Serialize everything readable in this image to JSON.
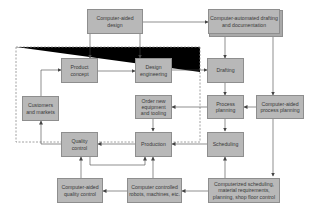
{
  "diagram": {
    "title": "",
    "boundary": "dashed",
    "nodes": [
      {
        "id": "cad",
        "label": "Computer-aided design"
      },
      {
        "id": "cadd",
        "label": "Computer-automated drafting and documentation"
      },
      {
        "id": "product_concept",
        "label": "Product concept"
      },
      {
        "id": "design_engineering",
        "label": "Design engineering"
      },
      {
        "id": "drafting",
        "label": "Drafting"
      },
      {
        "id": "customers",
        "label": "Customers and markets"
      },
      {
        "id": "order_equipment",
        "label": "Order new equipment and tooling"
      },
      {
        "id": "process_planning",
        "label": "Process planning"
      },
      {
        "id": "capp",
        "label": "Computer-aided process planning"
      },
      {
        "id": "quality_control",
        "label": "Quality control"
      },
      {
        "id": "production",
        "label": "Production"
      },
      {
        "id": "scheduling",
        "label": "Scheduling"
      },
      {
        "id": "caqc",
        "label": "Computer-aided quality control"
      },
      {
        "id": "robots",
        "label": "Computer controlled robots, machines, etc."
      },
      {
        "id": "computerized_scheduling",
        "label": "Computerized scheduling, material requirements, planning, shop floor control"
      }
    ],
    "edges": [
      {
        "from": "cad",
        "to": "cadd"
      },
      {
        "from": "cad",
        "to": "product_concept"
      },
      {
        "from": "cad",
        "to": "design_engineering"
      },
      {
        "from": "cadd",
        "to": "drafting"
      },
      {
        "from": "cadd",
        "to": "capp"
      },
      {
        "from": "customers",
        "to": "product_concept"
      },
      {
        "from": "product_concept",
        "to": "design_engineering"
      },
      {
        "from": "design_engineering",
        "to": "drafting"
      },
      {
        "from": "drafting",
        "to": "process_planning"
      },
      {
        "from": "capp",
        "to": "process_planning"
      },
      {
        "from": "process_planning",
        "to": "order_equipment"
      },
      {
        "from": "process_planning",
        "to": "scheduling"
      },
      {
        "from": "order_equipment",
        "to": "production"
      },
      {
        "from": "scheduling",
        "to": "production"
      },
      {
        "from": "production",
        "to": "quality_control"
      },
      {
        "from": "quality_control",
        "to": "customers"
      },
      {
        "from": "quality_control",
        "to": "production"
      },
      {
        "from": "capp",
        "to": "computerized_scheduling"
      },
      {
        "from": "computerized_scheduling",
        "to": "scheduling"
      },
      {
        "from": "computerized_scheduling",
        "to": "robots"
      },
      {
        "from": "robots",
        "to": "production"
      },
      {
        "from": "robots",
        "to": "caqc"
      },
      {
        "from": "caqc",
        "to": "quality_control"
      }
    ]
  }
}
